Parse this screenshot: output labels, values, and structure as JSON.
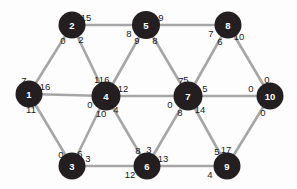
{
  "figure": {
    "name": "weighted-graph-diagram",
    "background_color": "#fdfdfd",
    "node_color": "#231f20",
    "node_text_color": "#ffffff",
    "edge_color": "#a6a6a6",
    "label_color": "#1b1b1b"
  },
  "nodes": [
    {
      "id": "1",
      "label": "1",
      "x": 29,
      "y": 94,
      "r": 13.5
    },
    {
      "id": "2",
      "label": "2",
      "x": 72,
      "y": 25,
      "r": 13.5
    },
    {
      "id": "3",
      "label": "3",
      "x": 72,
      "y": 166,
      "r": 13.5
    },
    {
      "id": "4",
      "label": "4",
      "x": 106,
      "y": 96,
      "r": 14.5
    },
    {
      "id": "5",
      "label": "5",
      "x": 146,
      "y": 25,
      "r": 14.0
    },
    {
      "id": "6",
      "label": "6",
      "x": 147,
      "y": 166,
      "r": 13.5
    },
    {
      "id": "7",
      "label": "7",
      "x": 188,
      "y": 96,
      "r": 14.5
    },
    {
      "id": "8",
      "label": "8",
      "x": 228,
      "y": 25,
      "r": 13.5
    },
    {
      "id": "9",
      "label": "9",
      "x": 227,
      "y": 166,
      "r": 13.5
    },
    {
      "id": "10",
      "label": "10",
      "x": 270,
      "y": 96,
      "r": 13.5
    }
  ],
  "edges": [
    {
      "from": "2",
      "to": "5",
      "label_from": "15",
      "label_to": "8"
    },
    {
      "from": "5",
      "to": "8",
      "label_from": "9",
      "label_to": "7"
    },
    {
      "from": "1",
      "to": "2",
      "label_from": "7",
      "label_to": "0"
    },
    {
      "from": "2",
      "to": "4",
      "label_from": "2",
      "label_to": "11"
    },
    {
      "from": "4",
      "to": "5",
      "label_from": "6",
      "label_to": "9"
    },
    {
      "from": "5",
      "to": "7",
      "label_from": "8",
      "label_to": "5"
    },
    {
      "from": "7",
      "to": "8",
      "label_from": "7",
      "label_to": "6"
    },
    {
      "from": "8",
      "to": "10",
      "label_from": "10",
      "label_to": "0"
    },
    {
      "from": "1",
      "to": "4",
      "label_from": "16",
      "label_to": "0"
    },
    {
      "from": "4",
      "to": "7",
      "label_from": "12",
      "label_to": "0"
    },
    {
      "from": "7",
      "to": "10",
      "label_from": "5",
      "label_to": "0"
    },
    {
      "from": "1",
      "to": "3",
      "label_from": "11",
      "label_to": "0"
    },
    {
      "from": "3",
      "to": "4",
      "label_from": "6",
      "label_to": "10"
    },
    {
      "from": "4",
      "to": "6",
      "label_from": "4",
      "label_to": "8"
    },
    {
      "from": "6",
      "to": "7",
      "label_from": "3",
      "label_to": "8"
    },
    {
      "from": "7",
      "to": "9",
      "label_from": "14",
      "label_to": "5"
    },
    {
      "from": "9",
      "to": "10",
      "label_from": "17",
      "label_to": "0"
    },
    {
      "from": "3",
      "to": "6",
      "label_from": "3",
      "label_to": "12"
    },
    {
      "from": "6",
      "to": "9",
      "label_from": "13",
      "label_to": "4"
    }
  ],
  "edge_label_offsets": [
    {
      "edge": "2-5",
      "from": [
        14,
        -8
      ],
      "to": [
        -17,
        8
      ]
    },
    {
      "edge": "5-8",
      "from": [
        15,
        -8
      ],
      "to": [
        -17,
        8
      ]
    },
    {
      "edge": "1-2",
      "from": [
        -5,
        -14
      ],
      "to": [
        -9,
        15
      ]
    },
    {
      "edge": "2-4",
      "from": [
        9,
        14
      ],
      "to": [
        -7,
        -17
      ]
    },
    {
      "edge": "4-5",
      "from": [
        1,
        -17
      ],
      "to": [
        -9,
        15
      ]
    },
    {
      "edge": "5-7",
      "from": [
        9,
        15
      ],
      "to": [
        -2,
        -17
      ]
    },
    {
      "edge": "7-8",
      "from": [
        -7,
        -16
      ],
      "to": [
        -8,
        16
      ]
    },
    {
      "edge": "8-10",
      "from": [
        11,
        11
      ],
      "to": [
        -3,
        -17
      ]
    },
    {
      "edge": "1-4",
      "from": [
        16,
        -8
      ],
      "to": [
        -16,
        8
      ]
    },
    {
      "edge": "4-7",
      "from": [
        17,
        -8
      ],
      "to": [
        -18,
        8
      ]
    },
    {
      "edge": "7-10",
      "from": [
        17,
        -8
      ],
      "to": [
        -19,
        -8
      ]
    },
    {
      "edge": "1-3",
      "from": [
        2,
        15
      ],
      "to": [
        -11,
        -12
      ]
    },
    {
      "edge": "3-4",
      "from": [
        8,
        -13
      ],
      "to": [
        -5,
        17
      ]
    },
    {
      "edge": "4-6",
      "from": [
        10,
        13
      ],
      "to": [
        -9,
        -16
      ]
    },
    {
      "edge": "6-7",
      "from": [
        2,
        -17
      ],
      "to": [
        -8,
        16
      ]
    },
    {
      "edge": "7-9",
      "from": [
        12,
        13
      ],
      "to": [
        -10,
        -15
      ]
    },
    {
      "edge": "9-10",
      "from": [
        -1,
        -17
      ],
      "to": [
        -7,
        16
      ]
    },
    {
      "edge": "3-6",
      "from": [
        16,
        -8
      ],
      "to": [
        -17,
        8
      ]
    },
    {
      "edge": "6-9",
      "from": [
        16,
        -8
      ],
      "to": [
        -17,
        8
      ]
    }
  ]
}
